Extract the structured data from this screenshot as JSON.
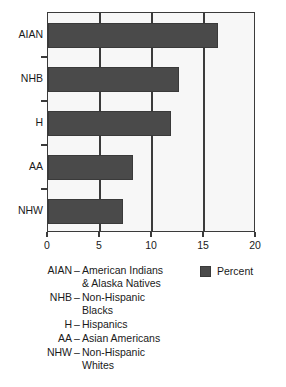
{
  "chart_data": {
    "type": "bar",
    "orientation": "horizontal",
    "title": "",
    "xlabel": "",
    "ylabel": "",
    "xlim": [
      0,
      20
    ],
    "xticks": [
      0,
      5,
      10,
      15,
      20
    ],
    "xtick_labels": [
      "0",
      "5",
      "10",
      "15",
      "20"
    ],
    "grid": true,
    "legend_position": "below-right",
    "categories": [
      "AIAN",
      "NHB",
      "H",
      "AA",
      "NHW"
    ],
    "series": [
      {
        "name": "Percent",
        "color": "#4a4a4a",
        "values": [
          16.3,
          12.6,
          11.8,
          8.2,
          7.2
        ]
      }
    ]
  },
  "legend": {
    "swatch_color": "#4a4a4a",
    "label": "Percent"
  },
  "key": {
    "rows": [
      {
        "abbr": "AIAN",
        "dash": "–",
        "lines": [
          "American Indians",
          "& Alaska Natives"
        ]
      },
      {
        "abbr": "NHB",
        "dash": "–",
        "lines": [
          "Non-Hispanic",
          "Blacks"
        ]
      },
      {
        "abbr": "H",
        "dash": "–",
        "lines": [
          "Hispanics"
        ]
      },
      {
        "abbr": "AA",
        "dash": "–",
        "lines": [
          "Asian Americans"
        ]
      },
      {
        "abbr": "NHW",
        "dash": "–",
        "lines": [
          "Non-Hispanic",
          "Whites"
        ]
      }
    ]
  }
}
